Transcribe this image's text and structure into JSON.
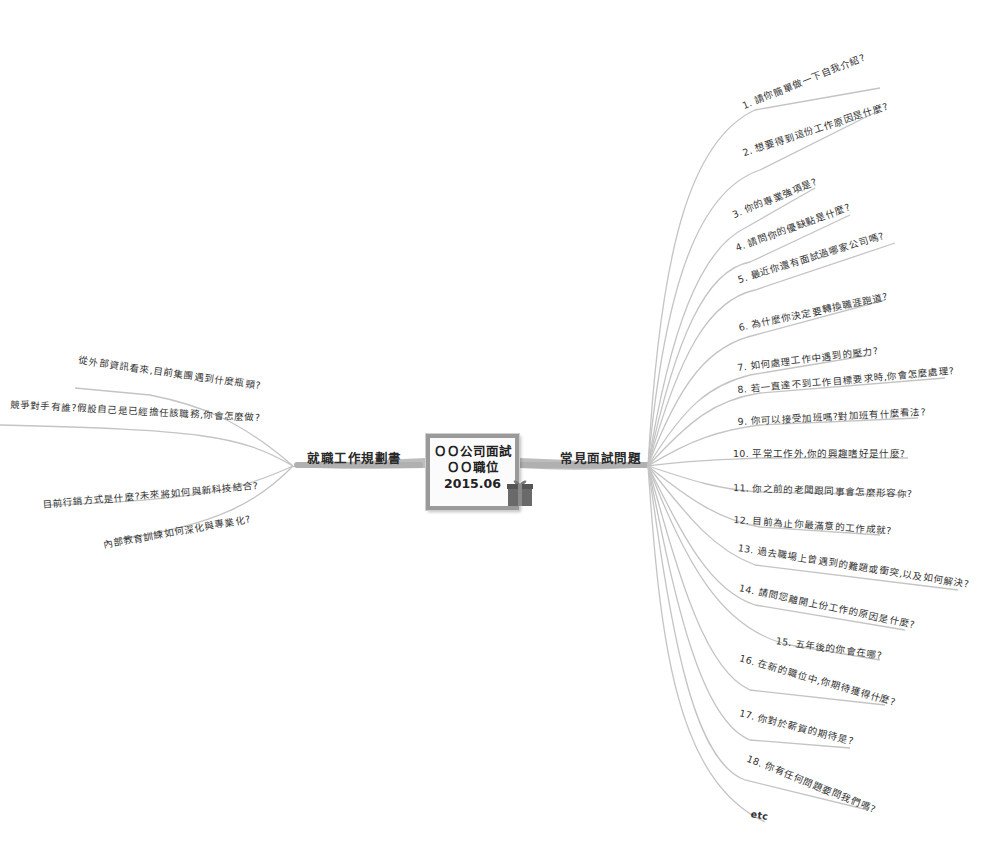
{
  "central_topic": {
    "line1": "ＯＯ公司面試",
    "line2": "ＯＯ職位",
    "line3": "2015.06",
    "icon": "gift-icon"
  },
  "left_branch": {
    "label": "就職工作規劃書",
    "items": [
      "從外部資訊看來,目前集團遇到什麼瓶頸?",
      "競爭對手有誰?假設自己是已經擔任該職務,你會怎麼做?",
      "目前行銷方式是什麼?未來將如何與新科技結合?",
      "內部教育訓練如何深化與專業化?"
    ]
  },
  "right_branch": {
    "label": "常見面試問題",
    "items": [
      "1. 請你簡單做一下自我介紹?",
      "2. 想要得到這份工作原因是什麼?",
      "3. 你的專業強項是?",
      "4. 請問你的優缺點是什麼?",
      "5. 最近你還有面試過哪家公司嗎?",
      "6. 為什麼你決定要轉換職涯跑道?",
      "7. 如何處理工作中遇到的壓力?",
      "8. 若一直達不到工作目標要求時,你會怎麼處理?",
      "9. 你可以接受加班嗎?對加班有什麼看法?",
      "10. 平常工作外,你的興趣嗜好是什麼?",
      "11. 你之前的老闆跟同事會怎麼形容你?",
      "12. 目前為止你最滿意的工作成就?",
      "13. 過去職場上曾遇到的難題或衝突,以及如何解決?",
      "14. 請問您離開上份工作的原因是什麼?",
      "15. 五年後的你會在哪?",
      "16. 在新的職位中,你期待獲得什麼?",
      "17. 你對於薪資的期待是?",
      "18. 你有任何問題要問我們嗎?",
      "etc"
    ]
  },
  "colors": {
    "branch_line": "#c4c4c4",
    "trunk": "#bdbdbd",
    "center_border": "#9a9a9a",
    "text": "#2a2a2a",
    "gift": "#6a6a6a"
  }
}
